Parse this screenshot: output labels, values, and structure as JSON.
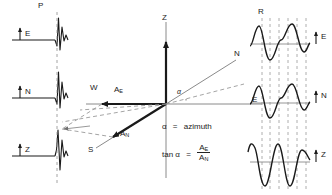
{
  "figure": {
    "background": "#ffffff",
    "ink_color": "#1a1a1a",
    "dash_color": "#7a7a7a",
    "width": 332,
    "height": 195
  },
  "left_panel": {
    "name": "p-wave-first-motion-traces",
    "phase_label": "P",
    "traces": [
      {
        "component": "E",
        "arrow": "up",
        "label": "E"
      },
      {
        "component": "N",
        "arrow": "up",
        "label": "N"
      },
      {
        "component": "Z",
        "arrow": "up",
        "label": "Z"
      }
    ]
  },
  "center_panel": {
    "name": "vector-decomposition",
    "axes": [
      {
        "id": "Z",
        "label": "Z",
        "direction": "up"
      },
      {
        "id": "E",
        "label": "E",
        "direction": "right"
      },
      {
        "id": "W",
        "label": "W",
        "direction": "left"
      },
      {
        "id": "N",
        "label": "N",
        "direction": "upper-right"
      },
      {
        "id": "S",
        "label": "S",
        "direction": "lower-left"
      }
    ],
    "vectors": [
      {
        "id": "A_E",
        "base": "A",
        "sub": "E",
        "direction": "west"
      },
      {
        "id": "A_N",
        "base": "A",
        "sub": "N",
        "direction": "south"
      }
    ],
    "angle": {
      "symbol": "α",
      "marker": "α"
    },
    "equations": [
      {
        "id": "azimuth-definition",
        "lhs": "α",
        "op": "=",
        "rhs": "azimuth"
      },
      {
        "id": "tangent-azimuth",
        "lhs": "tan α",
        "op": "=",
        "numerator_base": "A",
        "numerator_sub": "E",
        "denominator_base": "A",
        "denominator_sub": "N"
      }
    ]
  },
  "right_panel": {
    "name": "rayleigh-wave-traces",
    "phase_label": "R",
    "traces": [
      {
        "component": "E",
        "arrow": "up",
        "label": "E"
      },
      {
        "component": "N",
        "arrow": "up",
        "label": "N"
      },
      {
        "component": "Z",
        "arrow": "up",
        "label": "Z"
      }
    ],
    "correlation_lines": "vertical-dashed"
  }
}
